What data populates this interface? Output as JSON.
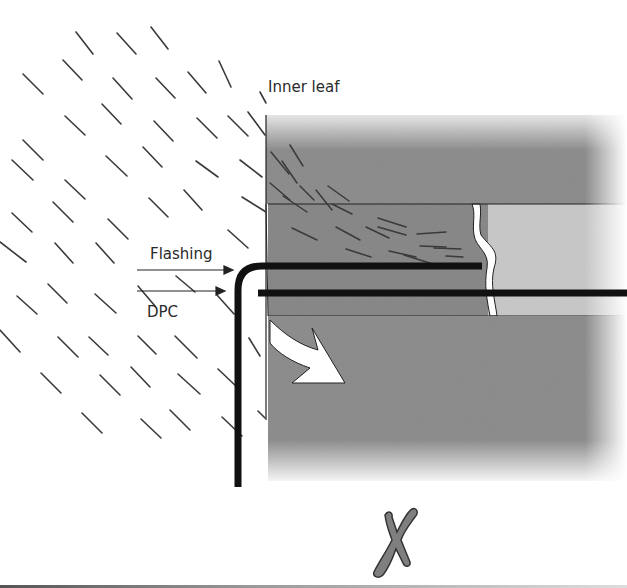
{
  "diagram": {
    "labels": {
      "inner_leaf": "Inner leaf",
      "flashing": "Flashing",
      "dpc": "DPC"
    },
    "verdict_mark": "✗",
    "verdict_meaning": "incorrect",
    "colors": {
      "wall_dark": "#8f8f8f",
      "wall_mid": "#8a8a8a",
      "wall_light": "#c9c9c9",
      "membrane": "#111111",
      "rain": "#333333",
      "cross": "#7a7a7a",
      "background": "#ffffff"
    }
  }
}
